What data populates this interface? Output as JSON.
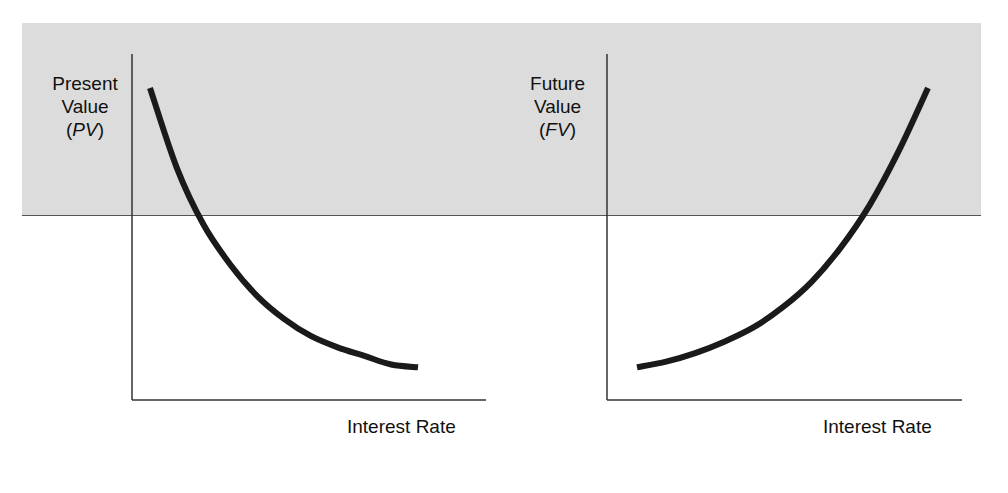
{
  "chart_data": [
    {
      "type": "line",
      "title": "",
      "ylabel": "Present Value (PV)",
      "ylabel_lines": [
        "Present",
        "Value"
      ],
      "ylabel_symbol": "PV",
      "xlabel": "Interest Rate",
      "grid": false,
      "legend": null,
      "trend": "decreasing, convex",
      "x": [
        0.0,
        0.1,
        0.2,
        0.3,
        0.4,
        0.5,
        0.6,
        0.7,
        0.8,
        0.9,
        1.0
      ],
      "values": [
        1.0,
        0.72,
        0.52,
        0.38,
        0.27,
        0.19,
        0.13,
        0.09,
        0.06,
        0.03,
        0.02
      ]
    },
    {
      "type": "line",
      "title": "",
      "ylabel": "Future Value (FV)",
      "ylabel_lines": [
        "Future",
        "Value"
      ],
      "ylabel_symbol": "FV",
      "xlabel": "Interest Rate",
      "grid": false,
      "legend": null,
      "trend": "increasing, convex",
      "x": [
        0.0,
        0.1,
        0.2,
        0.3,
        0.4,
        0.5,
        0.6,
        0.7,
        0.8,
        0.9,
        1.0
      ],
      "values": [
        0.02,
        0.04,
        0.07,
        0.11,
        0.16,
        0.23,
        0.32,
        0.44,
        0.59,
        0.78,
        1.0
      ]
    }
  ],
  "colors": {
    "panel_bg": "#dcdcdc",
    "curve": "#1a1a1a",
    "axis": "#333333"
  }
}
